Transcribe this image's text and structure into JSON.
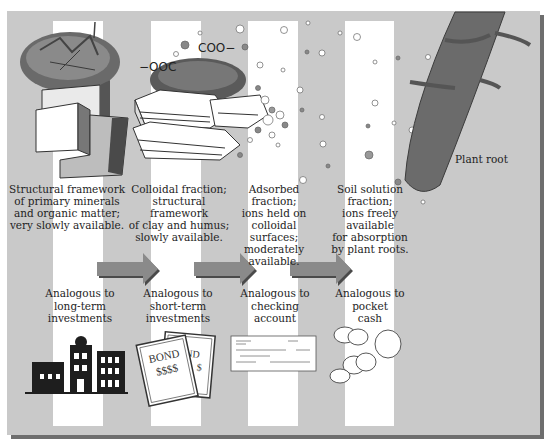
{
  "diagram": {
    "fractions": [
      {
        "id": "structural",
        "description": "Structural framework\nof primary minerals\nand organic matter;\nvery slowly available.",
        "analogy": "Analogous to\nlong-term\ninvestments",
        "analogy_icon": "buildings-icon"
      },
      {
        "id": "colloidal",
        "description": "Colloidal fraction;\nstructural framework\nof clay and humus;\nslowly available.",
        "analogy": "Analogous to\nshort-term\ninvestments",
        "analogy_icon": "bond-certificate-icon"
      },
      {
        "id": "adsorbed",
        "description": "Adsorbed\nfraction;\nions held on\ncolloidal surfaces;\nmoderately\navailable.",
        "analogy": "Analogous to\nchecking\naccount",
        "analogy_icon": "bank-check-icon"
      },
      {
        "id": "soil-solution",
        "description": "Soil solution\nfraction;\nions freely available\nfor absorption\nby plant roots.",
        "analogy": "Analogous to\npocket\ncash",
        "analogy_icon": "coins-icon"
      }
    ],
    "plant_root_label": "Plant root",
    "chem_labels": [
      "COO−",
      "−OOC"
    ],
    "bond_text": [
      "BOND",
      "$$$$",
      "ND",
      "$"
    ],
    "colors": {
      "background": "#c9c9c9",
      "strip": "#ffffff",
      "arrow": "#8a8a8a",
      "arrow_shadow": "#4a4a4a",
      "root": "#6b6b6b",
      "frame_shadow": "#6e6e6e"
    }
  }
}
